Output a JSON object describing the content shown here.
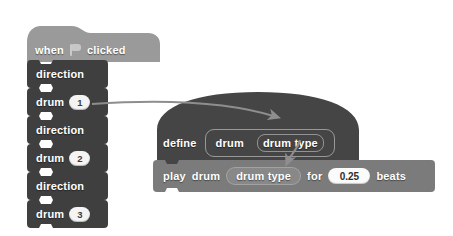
{
  "app": {
    "title": "Scratch script editor",
    "description": "Scratch block script with a custom block definition"
  },
  "colors": {
    "event_block": "#9a9a9a",
    "dark_block": "#3f3f3f",
    "define_block": "#454545",
    "play_block": "#7b7b7b",
    "block_text": "#ffffff",
    "input_field": "#fbfbfb",
    "input_text": "#2e2e2e",
    "arrow": "#8e8e8e",
    "canvas": "#ffffff"
  },
  "event_script": {
    "hat": {
      "prefix_label": "when",
      "flag_icon": "green-flag-icon",
      "suffix_label": "clicked"
    },
    "blocks": [
      {
        "label": "direction",
        "value": null
      },
      {
        "label": "drum",
        "value": "1"
      },
      {
        "label": "direction",
        "value": null
      },
      {
        "label": "drum",
        "value": "2"
      },
      {
        "label": "direction",
        "value": null
      },
      {
        "label": "drum",
        "value": "3"
      }
    ]
  },
  "definition": {
    "keyword": "define",
    "block_name": "drum",
    "parameter": "drum type"
  },
  "body": {
    "play_label_1": "play",
    "play_label_2": "drum",
    "argument": "drum type",
    "for_label": "for",
    "beats_value": "0.25",
    "beats_label": "beats"
  },
  "annotations": {
    "arrow_1": "arrow-from-drum-1-to-parameter",
    "arrow_2": "arrow-from-parameter-to-argument"
  }
}
